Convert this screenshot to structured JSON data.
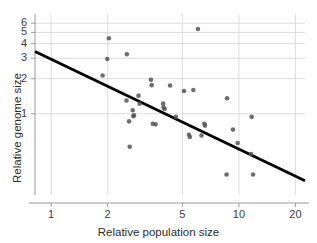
{
  "chart_data": {
    "type": "scatter",
    "title": "",
    "xlabel": "Relative population size",
    "ylabel": "Relative genome size",
    "xscale": "log",
    "yscale": "log",
    "xlim": [
      0.82,
      22.5
    ],
    "ylim": [
      0.2,
      7.2
    ],
    "grid": true,
    "legend": null,
    "xticks": [
      1,
      2,
      5,
      10,
      20
    ],
    "xtick_labels": [
      "1",
      "2",
      "5",
      "10",
      "20"
    ],
    "yticks": [
      1,
      2,
      3,
      4,
      5,
      6
    ],
    "ytick_labels": [
      "1",
      "2",
      "3",
      "4",
      "5",
      "6"
    ],
    "marker": {
      "shape": "circle",
      "color": "#555555",
      "size_px": 4.6,
      "opacity": 0.85
    },
    "points": [
      {
        "x": 1.88,
        "y": 2.13
      },
      {
        "x": 2.03,
        "y": 4.45
      },
      {
        "x": 1.99,
        "y": 2.95
      },
      {
        "x": 2.53,
        "y": 3.25
      },
      {
        "x": 2.52,
        "y": 1.3
      },
      {
        "x": 2.6,
        "y": 0.86
      },
      {
        "x": 2.72,
        "y": 1.07
      },
      {
        "x": 2.74,
        "y": 0.95
      },
      {
        "x": 2.76,
        "y": 0.97
      },
      {
        "x": 2.62,
        "y": 0.52
      },
      {
        "x": 2.92,
        "y": 1.43
      },
      {
        "x": 2.96,
        "y": 1.22
      },
      {
        "x": 3.4,
        "y": 1.96
      },
      {
        "x": 3.43,
        "y": 1.76
      },
      {
        "x": 3.48,
        "y": 0.82
      },
      {
        "x": 3.6,
        "y": 0.81
      },
      {
        "x": 3.95,
        "y": 1.22
      },
      {
        "x": 3.97,
        "y": 1.13
      },
      {
        "x": 4.02,
        "y": 1.1
      },
      {
        "x": 4.3,
        "y": 1.75
      },
      {
        "x": 4.62,
        "y": 0.94
      },
      {
        "x": 5.1,
        "y": 1.57
      },
      {
        "x": 5.42,
        "y": 0.66
      },
      {
        "x": 5.48,
        "y": 0.63
      },
      {
        "x": 5.72,
        "y": 1.6
      },
      {
        "x": 6.05,
        "y": 5.35
      },
      {
        "x": 6.32,
        "y": 0.65
      },
      {
        "x": 6.55,
        "y": 0.82
      },
      {
        "x": 6.6,
        "y": 0.79
      },
      {
        "x": 8.65,
        "y": 1.36
      },
      {
        "x": 8.6,
        "y": 0.3
      },
      {
        "x": 9.3,
        "y": 0.73
      },
      {
        "x": 9.85,
        "y": 0.56
      },
      {
        "x": 11.7,
        "y": 0.94
      },
      {
        "x": 11.6,
        "y": 0.45
      },
      {
        "x": 11.9,
        "y": 0.3
      }
    ],
    "trendline": {
      "type": "linear-on-log-log",
      "color": "#000000",
      "width_px": 2.8,
      "start": {
        "x": 0.82,
        "y": 3.42
      },
      "end": {
        "x": 22.5,
        "y": 0.265
      }
    },
    "style": {
      "grid_color": "#d8d8d8",
      "axis_color": "#9a9a9a",
      "background": "#ffffff",
      "text_color": "#2b2b2b"
    }
  }
}
